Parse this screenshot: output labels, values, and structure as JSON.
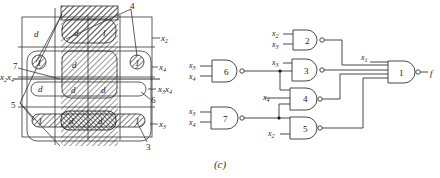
{
  "caption": "(c)",
  "kmap": {
    "title": "Karnaugh map with implicant groupings",
    "cells": [
      [
        "d",
        "d",
        "1",
        ""
      ],
      [
        "1",
        "d",
        "",
        "1"
      ],
      [
        "d",
        "d",
        "d",
        ""
      ],
      [
        "1",
        "d",
        "d",
        "1"
      ]
    ],
    "row_labels": [
      {
        "var": "x",
        "sub": "2"
      },
      {
        "var": "x",
        "sub": "4"
      },
      {
        "var": "x",
        "sub": "3",
        "var2": "x",
        "sub2": "4"
      },
      {
        "var": "x",
        "sub": "3"
      }
    ],
    "left_label": {
      "var": "x",
      "sub": "2",
      "var2": "x",
      "sub2": "4"
    },
    "group_callouts": [
      "4",
      "7",
      "5",
      "6",
      "3"
    ]
  },
  "circuit": {
    "output": "f",
    "gates": [
      {
        "id": "1",
        "inputs": [
          "x1",
          "g2",
          "g3",
          "g4",
          "g5"
        ]
      },
      {
        "id": "2",
        "inputs": [
          "x2",
          "x3"
        ]
      },
      {
        "id": "3",
        "inputs": [
          "x3",
          "g6"
        ]
      },
      {
        "id": "4",
        "inputs": [
          "x4",
          "g6",
          "g7"
        ]
      },
      {
        "id": "5",
        "inputs": [
          "g7",
          "x2"
        ]
      },
      {
        "id": "6",
        "inputs": [
          "x3",
          "x4"
        ]
      },
      {
        "id": "7",
        "inputs": [
          "x3",
          "x4"
        ]
      }
    ],
    "labels": {
      "g1": "1",
      "g2": "2",
      "g3": "3",
      "g4": "4",
      "g5": "5",
      "g6": "6",
      "g7": "7",
      "x": "x",
      "s1": "1",
      "s2": "2",
      "s3": "3",
      "s4": "4"
    }
  }
}
